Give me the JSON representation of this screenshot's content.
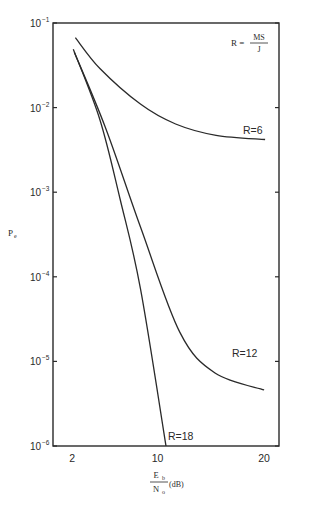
{
  "chart_data": {
    "type": "line",
    "title": "",
    "xlabel": "Eb/No (dB)",
    "xlabel_num": "E",
    "xlabel_num_sub": "b",
    "xlabel_den": "N",
    "xlabel_den_sub": "o",
    "xlabel_unit": "(dB)",
    "ylabel": "Pe",
    "ylabel_main": "P",
    "ylabel_sub": "e",
    "xscale": "linear",
    "yscale": "log",
    "xlim": [
      0.2,
      21.4
    ],
    "ylim": [
      1e-06,
      0.1
    ],
    "grid": false,
    "legend": "inline labels",
    "x_ticks": [
      2,
      10,
      20
    ],
    "x_tick_labels": [
      "2",
      "10",
      "20"
    ],
    "y_ticks": [
      0.1,
      0.01,
      0.001,
      0.0001,
      1e-05,
      1e-06
    ],
    "y_tick_labels": [
      {
        "base": "10",
        "exp": "-1"
      },
      {
        "base": "10",
        "exp": "-2"
      },
      {
        "base": "10",
        "exp": "-3"
      },
      {
        "base": "10",
        "exp": "-4"
      },
      {
        "base": "10",
        "exp": "-5"
      },
      {
        "base": "10",
        "exp": "-6"
      }
    ],
    "annotation": {
      "lhs": "R = ",
      "num": "MS",
      "den": "J"
    },
    "series": [
      {
        "name": "R=6",
        "label": "R=6",
        "x": [
          2.3,
          4.6,
          8.4,
          11.7,
          15.5,
          20.1
        ],
        "y": [
          0.067,
          0.029,
          0.011,
          0.0064,
          0.0047,
          0.0042
        ]
      },
      {
        "name": "R=12",
        "label": "R=12",
        "x": [
          2.2,
          5.1,
          8.4,
          12.1,
          15.4,
          20.0
        ],
        "y": [
          0.045,
          0.0059,
          0.00039,
          2.2e-05,
          7.3e-06,
          4.6e-06
        ]
      },
      {
        "name": "R=18",
        "label": "R=18",
        "x": [
          2.1,
          4.6,
          6.5,
          8.4,
          10.8
        ],
        "y": [
          0.049,
          0.0072,
          0.00082,
          7.3e-05,
          1e-06
        ]
      }
    ]
  }
}
